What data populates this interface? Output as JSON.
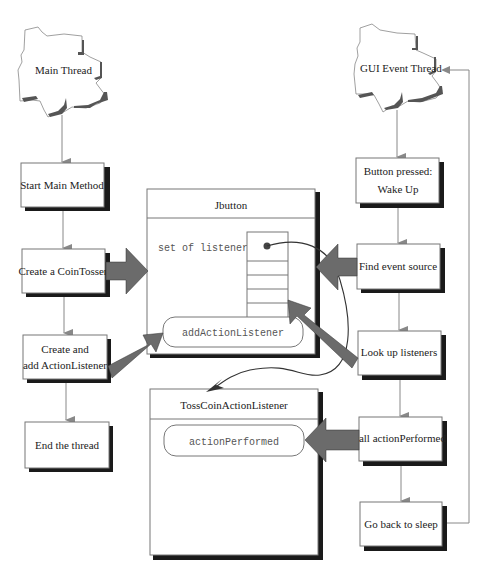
{
  "diagram": {
    "threads": {
      "main": {
        "label": "Main Thread"
      },
      "gui": {
        "label": "GUI Event Thread"
      }
    },
    "main_flow": [
      {
        "label": "Start Main Method"
      },
      {
        "label": "Create a CoinTosser"
      },
      {
        "label_line1": "Create and",
        "label_line2": "add ActionListener"
      },
      {
        "label": "End the thread"
      }
    ],
    "gui_flow": [
      {
        "label_line1": "Button pressed:",
        "label_line2": "Wake Up"
      },
      {
        "label": "Find event source"
      },
      {
        "label": "Look up listeners"
      },
      {
        "label": "call actionPerformed"
      },
      {
        "label": "Go back to sleep"
      }
    ],
    "jbutton": {
      "title": "Jbutton",
      "field": "set of listeners",
      "method": "addActionListener"
    },
    "listener": {
      "title": "TossCoinActionListener",
      "method": "actionPerformed"
    },
    "colors": {
      "fat_arrow": "#6b6b6b",
      "shadow": "#1a1a1a",
      "connector": "#888888"
    }
  }
}
